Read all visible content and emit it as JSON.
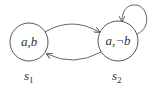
{
  "diagram": {
    "type": "kripke-structure",
    "states": [
      {
        "id": "s1",
        "label": "a,b",
        "name_base": "s",
        "name_sub": "1",
        "cx": 29,
        "cy": 42,
        "r": 19
      },
      {
        "id": "s2",
        "label": "a,¬b",
        "name_base": "s",
        "name_sub": "2",
        "cx": 118,
        "cy": 41,
        "r": 20
      }
    ],
    "transitions": [
      {
        "from": "s1",
        "to": "s2"
      },
      {
        "from": "s2",
        "to": "s1"
      },
      {
        "from": "s2",
        "to": "s2"
      }
    ],
    "colors": {
      "stroke": "#555555",
      "text": "#333333",
      "background": "#ffffff"
    }
  }
}
